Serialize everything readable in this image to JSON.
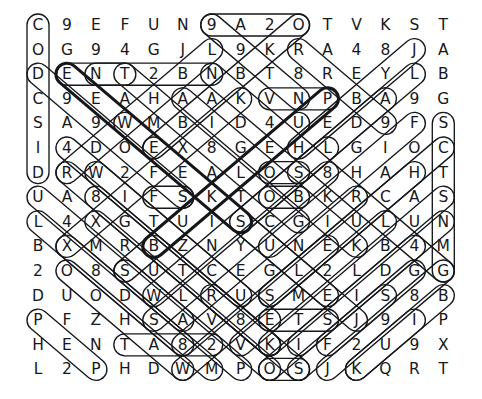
{
  "puzzle": {
    "title": "Word Search Puzzle",
    "type": "word-search-grid",
    "rows": 15,
    "cols": 15,
    "ink_color": "#17181a",
    "marker_color": "#15171a",
    "background_color": "#ffffff",
    "grid": [
      [
        "C",
        "9",
        "E",
        "F",
        "U",
        "N",
        "9",
        "A",
        "2",
        "O",
        "T",
        "V",
        "K",
        "S",
        "T"
      ],
      [
        "O",
        "G",
        "9",
        "4",
        "G",
        "J",
        "L",
        "9",
        "K",
        "R",
        "A",
        "4",
        "8",
        "J",
        "A"
      ],
      [
        "D",
        "E",
        "N",
        "T",
        "2",
        "B",
        "N",
        "B",
        "T",
        "8",
        "R",
        "E",
        "Y",
        "L",
        "B"
      ],
      [
        "C",
        "9",
        "E",
        "A",
        "H",
        "A",
        "A",
        "K",
        "V",
        "N",
        "P",
        "B",
        "A",
        "9",
        "G"
      ],
      [
        "S",
        "A",
        "9",
        "W",
        "M",
        "B",
        "I",
        "D",
        "4",
        "U",
        "E",
        "D",
        "9",
        "F",
        "S"
      ],
      [
        "I",
        "4",
        "D",
        "O",
        "E",
        "X",
        "8",
        "G",
        "E",
        "H",
        "L",
        "G",
        "I",
        "O",
        "C"
      ],
      [
        "D",
        "R",
        "W",
        "2",
        "F",
        "E",
        "A",
        "L",
        "O",
        "S",
        "8",
        "H",
        "A",
        "H",
        "T"
      ],
      [
        "U",
        "A",
        "8",
        "I",
        "F",
        "S",
        "K",
        "T",
        "O",
        "B",
        "K",
        "R",
        "C",
        "A",
        "S"
      ],
      [
        "L",
        "4",
        "X",
        "G",
        "T",
        "U",
        "I",
        "S",
        "C",
        "G",
        "I",
        "U",
        "L",
        "U",
        "N"
      ],
      [
        "B",
        "X",
        "M",
        "R",
        "B",
        "Z",
        "N",
        "Y",
        "U",
        "N",
        "E",
        "K",
        "B",
        "4",
        "M"
      ],
      [
        "2",
        "O",
        "8",
        "S",
        "U",
        "T",
        "C",
        "E",
        "G",
        "L",
        "2",
        "L",
        "D",
        "G",
        "G"
      ],
      [
        "D",
        "U",
        "O",
        "D",
        "W",
        "L",
        "R",
        "U",
        "S",
        "M",
        "E",
        "I",
        "S",
        "8",
        "B"
      ],
      [
        "P",
        "F",
        "Z",
        "H",
        "S",
        "A",
        "V",
        "8",
        "E",
        "T",
        "S",
        "J",
        "9",
        "I",
        "P"
      ],
      [
        "H",
        "E",
        "N",
        "T",
        "A",
        "8",
        "2",
        "V",
        "K",
        "I",
        "F",
        "2",
        "U",
        "9",
        "X"
      ],
      [
        "L",
        "2",
        "P",
        "H",
        "D",
        "W",
        "M",
        "P",
        "O",
        "S",
        "J",
        "K",
        "Q",
        "R",
        "T"
      ]
    ],
    "found_words": [
      {
        "label": "CODCSID",
        "start_row": 0,
        "start_col": 0,
        "end_row": 6,
        "end_col": 0,
        "bold": false
      },
      {
        "label": "SCTSNMG",
        "start_row": 4,
        "start_col": 14,
        "end_row": 10,
        "end_col": 14,
        "bold": false
      },
      {
        "label": "ENT",
        "start_row": 2,
        "start_col": 1,
        "end_row": 2,
        "end_col": 3,
        "bold": false
      },
      {
        "label": "NTB",
        "start_row": 2,
        "start_col": 2,
        "end_row": 2,
        "end_col": 6,
        "bold": false
      },
      {
        "label": "VNP",
        "start_row": 3,
        "start_col": 8,
        "end_row": 3,
        "end_col": 10,
        "bold": false
      },
      {
        "label": "OS",
        "start_row": 6,
        "start_col": 8,
        "end_row": 6,
        "end_col": 9,
        "bold": false
      },
      {
        "label": "OB",
        "start_row": 7,
        "start_col": 8,
        "end_row": 7,
        "end_col": 9,
        "bold": false
      },
      {
        "label": "FS",
        "start_row": 7,
        "start_col": 4,
        "end_row": 7,
        "end_col": 5,
        "bold": false
      },
      {
        "label": "ETS",
        "start_row": 12,
        "start_col": 8,
        "end_row": 12,
        "end_col": 10,
        "bold": false
      },
      {
        "label": "TA82",
        "start_row": 13,
        "start_col": 3,
        "end_row": 13,
        "end_col": 6,
        "bold": false
      },
      {
        "label": "OS",
        "start_row": 14,
        "start_col": 8,
        "end_row": 14,
        "end_col": 9,
        "bold": false
      },
      {
        "label": "9A2O",
        "start_row": 0,
        "start_col": 6,
        "end_row": 0,
        "end_col": 9,
        "bold": false
      }
    ],
    "diagonal_markers": [
      {
        "start_row": 0,
        "start_col": 9,
        "end_row": 5,
        "end_col": 4,
        "dir": "dl",
        "bold": false
      },
      {
        "start_row": 0,
        "start_col": 6,
        "end_row": 3,
        "end_col": 9,
        "dir": "dr",
        "bold": false
      },
      {
        "start_row": 1,
        "start_col": 6,
        "end_row": 6,
        "end_col": 1,
        "dir": "dl",
        "bold": false
      },
      {
        "start_row": 1,
        "start_col": 13,
        "end_row": 5,
        "end_col": 9,
        "dir": "dl",
        "bold": false
      },
      {
        "start_row": 2,
        "start_col": 1,
        "end_row": 8,
        "end_col": 7,
        "dir": "dr",
        "bold": true
      },
      {
        "start_row": 2,
        "start_col": 6,
        "end_row": 10,
        "end_col": 14,
        "dir": "dr",
        "bold": false
      },
      {
        "start_row": 3,
        "start_col": 7,
        "end_row": 9,
        "end_col": 1,
        "dir": "dl",
        "bold": false
      },
      {
        "start_row": 3,
        "start_col": 10,
        "end_row": 9,
        "end_col": 4,
        "dir": "dl",
        "bold": true
      },
      {
        "start_row": 2,
        "start_col": 0,
        "end_row": 7,
        "end_col": 5,
        "dir": "dr",
        "bold": false
      },
      {
        "start_row": 4,
        "start_col": 3,
        "end_row": 11,
        "end_col": 10,
        "dir": "dr",
        "bold": false
      },
      {
        "start_row": 5,
        "start_col": 4,
        "end_row": 12,
        "end_col": 11,
        "dir": "dr",
        "bold": false
      },
      {
        "start_row": 6,
        "start_col": 1,
        "end_row": 13,
        "end_col": 8,
        "dir": "dr",
        "bold": false
      },
      {
        "start_row": 7,
        "start_col": 0,
        "end_row": 12,
        "end_col": 5,
        "dir": "dr",
        "bold": false
      },
      {
        "start_row": 8,
        "start_col": 0,
        "end_row": 14,
        "end_col": 6,
        "dir": "dr",
        "bold": false
      },
      {
        "start_row": 10,
        "start_col": 1,
        "end_row": 14,
        "end_col": 5,
        "dir": "dr",
        "bold": false
      },
      {
        "start_row": 12,
        "start_col": 0,
        "end_row": 14,
        "end_col": 2,
        "dir": "dr",
        "bold": false
      },
      {
        "start_row": 6,
        "start_col": 13,
        "end_row": 11,
        "end_col": 8,
        "dir": "dl",
        "bold": false
      },
      {
        "start_row": 5,
        "start_col": 14,
        "end_row": 11,
        "end_col": 8,
        "dir": "dl",
        "bold": false
      },
      {
        "start_row": 7,
        "start_col": 14,
        "end_row": 13,
        "end_col": 8,
        "dir": "dl",
        "bold": false
      },
      {
        "start_row": 8,
        "start_col": 14,
        "end_row": 13,
        "end_col": 9,
        "dir": "dl",
        "bold": false
      },
      {
        "start_row": 9,
        "start_col": 13,
        "end_row": 14,
        "end_col": 8,
        "dir": "dl",
        "bold": false
      },
      {
        "start_row": 10,
        "start_col": 14,
        "end_row": 14,
        "end_col": 10,
        "dir": "dl",
        "bold": false
      },
      {
        "start_row": 11,
        "start_col": 14,
        "end_row": 14,
        "end_col": 11,
        "dir": "dl",
        "bold": false
      },
      {
        "start_row": 12,
        "start_col": 13,
        "end_row": 14,
        "end_col": 11,
        "dir": "dl",
        "bold": false
      },
      {
        "start_row": 9,
        "start_col": 4,
        "end_row": 14,
        "end_col": 9,
        "dir": "dr",
        "bold": false
      },
      {
        "start_row": 10,
        "start_col": 3,
        "end_row": 14,
        "end_col": 7,
        "dir": "dr",
        "bold": false
      },
      {
        "start_row": 11,
        "start_col": 6,
        "end_row": 13,
        "end_col": 8,
        "dir": "dr",
        "bold": false
      },
      {
        "start_row": 4,
        "start_col": 9,
        "end_row": 10,
        "end_col": 3,
        "dir": "dl",
        "bold": false
      },
      {
        "start_row": 5,
        "start_col": 10,
        "end_row": 11,
        "end_col": 4,
        "dir": "dl",
        "bold": false
      },
      {
        "start_row": 6,
        "start_col": 10,
        "end_row": 12,
        "end_col": 4,
        "dir": "dl",
        "bold": false
      },
      {
        "start_row": 7,
        "start_col": 11,
        "end_row": 13,
        "end_col": 5,
        "dir": "dl",
        "bold": false
      },
      {
        "start_row": 8,
        "start_col": 12,
        "end_row": 13,
        "end_col": 7,
        "dir": "dl",
        "bold": false
      },
      {
        "start_row": 9,
        "start_col": 10,
        "end_row": 14,
        "end_col": 5,
        "dir": "dl",
        "bold": false
      },
      {
        "start_row": 2,
        "start_col": 13,
        "end_row": 6,
        "end_col": 9,
        "dir": "dl",
        "bold": false
      },
      {
        "start_row": 3,
        "start_col": 12,
        "end_row": 8,
        "end_col": 7,
        "dir": "dl",
        "bold": false
      },
      {
        "start_row": 1,
        "start_col": 9,
        "end_row": 4,
        "end_col": 12,
        "dir": "dr",
        "bold": false
      },
      {
        "start_row": 3,
        "start_col": 5,
        "end_row": 9,
        "end_col": 11,
        "dir": "dr",
        "bold": false
      },
      {
        "start_row": 6,
        "start_col": 2,
        "end_row": 12,
        "end_col": 8,
        "dir": "dr",
        "bold": false
      },
      {
        "start_row": 7,
        "start_col": 2,
        "end_row": 13,
        "end_col": 8,
        "dir": "dr",
        "bold": false
      },
      {
        "start_row": 8,
        "start_col": 2,
        "end_row": 14,
        "end_col": 8,
        "dir": "dr",
        "bold": false
      },
      {
        "start_row": 2,
        "start_col": 3,
        "end_row": 8,
        "end_col": 9,
        "dir": "dr",
        "bold": false
      },
      {
        "start_row": 5,
        "start_col": 1,
        "end_row": 11,
        "end_col": 7,
        "dir": "dr",
        "bold": false
      },
      {
        "start_row": 9,
        "start_col": 1,
        "end_row": 13,
        "end_col": 5,
        "dir": "dr",
        "bold": false
      },
      {
        "start_row": 4,
        "start_col": 13,
        "end_row": 9,
        "end_col": 8,
        "dir": "dl",
        "bold": false
      },
      {
        "start_row": 10,
        "start_col": 13,
        "end_row": 13,
        "end_col": 10,
        "dir": "dl",
        "bold": false
      },
      {
        "start_row": 11,
        "start_col": 12,
        "end_row": 14,
        "end_col": 9,
        "dir": "dl",
        "bold": false
      }
    ]
  }
}
